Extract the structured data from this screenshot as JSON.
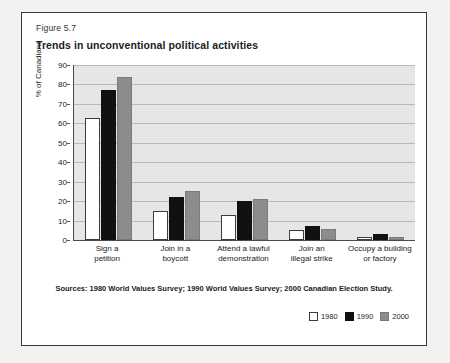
{
  "figure": {
    "number": "Figure 5.7",
    "title": "Trends in unconventional political activities",
    "source_note": "Sources: 1980 World Values Survey; 1990 World Values Survey; 2000 Canadian Election Study."
  },
  "legend": {
    "items": [
      {
        "label": "1980",
        "color": "#ffffff"
      },
      {
        "label": "1990",
        "color": "#111111"
      },
      {
        "label": "2000",
        "color": "#8c8c8c"
      }
    ]
  },
  "chart_data": {
    "type": "bar",
    "title": "Trends in unconventional political activities",
    "xlabel": "",
    "ylabel": "% of Canadians",
    "ylim": [
      0,
      90
    ],
    "yticks": [
      0,
      10,
      20,
      30,
      40,
      50,
      60,
      70,
      80,
      90
    ],
    "grid": true,
    "legend_position": "bottom-right",
    "categories": [
      "Sign a petition",
      "Join in a boycott",
      "Attend a lawful demonstration",
      "Join an illegal strike",
      "Occupy a building or factory"
    ],
    "category_lines": [
      [
        "Sign a",
        "petition"
      ],
      [
        "Join in a",
        "boycott"
      ],
      [
        "Attend a lawful",
        "demonstration"
      ],
      [
        "Join an",
        "illegal strike"
      ],
      [
        "Occupy a building",
        "or factory"
      ]
    ],
    "series": [
      {
        "name": "1980",
        "color": "#ffffff",
        "values": [
          63,
          15,
          13,
          5,
          1.5
        ]
      },
      {
        "name": "1990",
        "color": "#111111",
        "values": [
          77,
          22,
          20,
          7,
          3
        ]
      },
      {
        "name": "2000",
        "color": "#8c8c8c",
        "values": [
          84,
          25,
          21,
          5.5,
          1.5
        ]
      }
    ]
  }
}
